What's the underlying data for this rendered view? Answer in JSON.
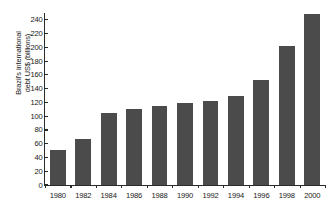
{
  "chart_data": {
    "type": "bar",
    "title": "",
    "xlabel": "",
    "ylabel": "Brazil's international debt US$ (billions)",
    "ylabel_line1": "Brazil's international",
    "ylabel_line2": "debt US$ (billions)",
    "categories": [
      "1980",
      "1982",
      "1984",
      "1986",
      "1988",
      "1990",
      "1992",
      "1994",
      "1996",
      "1998",
      "2000"
    ],
    "values": [
      51,
      67,
      105,
      110,
      115,
      119,
      122,
      129,
      152,
      202,
      248
    ],
    "ylim": [
      0,
      250
    ],
    "yticks": [
      0,
      20,
      40,
      60,
      80,
      100,
      120,
      140,
      160,
      180,
      200,
      220,
      240
    ],
    "ytick_labels": [
      "0",
      "20",
      "40",
      "60",
      "80",
      "100",
      "120",
      "140",
      "160",
      "180",
      "200",
      "220",
      "240"
    ],
    "grid": false,
    "legend": null,
    "bar_color": "#4b4b4b",
    "axis_color": "#2b2b2b",
    "background_color": "#ffffff"
  }
}
